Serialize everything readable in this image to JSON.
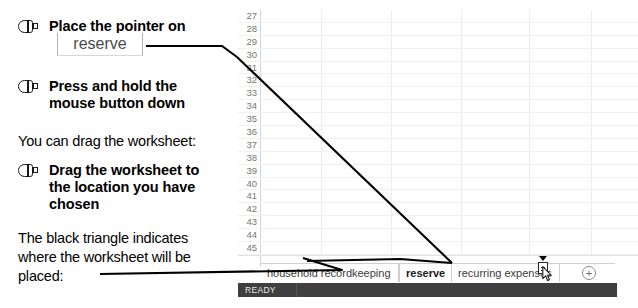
{
  "instructions": {
    "steps": [
      {
        "icon": "mouse-icon",
        "text": "Place the pointer on"
      },
      {
        "icon": "mouse-icon",
        "text": "Press and hold the mouse button down"
      },
      {
        "icon": "mouse-icon",
        "text": "Drag the worksheet to the location you have chosen"
      }
    ],
    "callout_tab_label": "reserve",
    "note_drag": "You can drag the worksheet:",
    "note_triangle": "The black triangle indicates where the worksheet will be placed:"
  },
  "spreadsheet": {
    "row_headers": [
      "27",
      "28",
      "29",
      "30",
      "31",
      "32",
      "33",
      "34",
      "35",
      "36",
      "37",
      "38",
      "39",
      "40",
      "41",
      "42",
      "43",
      "44",
      "45"
    ],
    "column_separator_x": [
      60,
      130,
      200,
      268,
      330,
      378
    ],
    "tabs": [
      {
        "label": "household recordkeeping",
        "active": false
      },
      {
        "label": "reserve",
        "active": true
      },
      {
        "label": "recurring expenses",
        "active": false
      }
    ],
    "add_sheet_icon": "plus-circle-icon",
    "add_sheet_label": "+",
    "drop_indicator": "black-triangle-icon",
    "drag_cursor": "drag-worksheet-cursor"
  },
  "statusbar": {
    "text": "READY"
  },
  "colors": {
    "statusbar_bg": "#3f3f3f",
    "statusbar_text": "#e8e8e8",
    "grid_line": "#ececec",
    "row_header_text": "#767676",
    "callout_text": "#4a4a4a",
    "leader_line": "#000000"
  }
}
